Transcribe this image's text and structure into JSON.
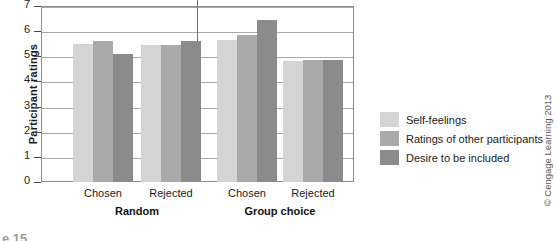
{
  "chart_data": {
    "type": "bar",
    "title": "",
    "xlabel": "",
    "ylabel": "Participant ratings",
    "ylim": [
      0,
      7
    ],
    "ytick_values": [
      0,
      1,
      2,
      3,
      4,
      5,
      6,
      7
    ],
    "ytick_labels": [
      "0",
      "1",
      "2",
      "3",
      "4",
      "5",
      "6",
      "7"
    ],
    "grid": true,
    "legend_position": "right",
    "categories": [
      "Chosen",
      "Rejected",
      "Chosen",
      "Rejected"
    ],
    "supercategories": [
      "Random",
      "Group choice"
    ],
    "series": [
      {
        "name": "Self-feelings",
        "color": "#d4d4d4",
        "values": [
          5.5,
          5.45,
          5.65,
          4.8
        ]
      },
      {
        "name": "Ratings of other participants",
        "color": "#aaaaaa",
        "values": [
          5.6,
          5.45,
          5.85,
          4.85
        ]
      },
      {
        "name": "Desire to be included",
        "color": "#8b8b8b",
        "values": [
          5.1,
          5.6,
          6.45,
          4.85
        ]
      }
    ]
  },
  "axis": {
    "y_title": "Participant ratings",
    "ticks": [
      "7",
      "6",
      "5",
      "4",
      "3",
      "2",
      "1",
      "0"
    ]
  },
  "x_axis": {
    "groups": [
      {
        "label": "Random",
        "ticks": [
          "Chosen",
          "Rejected"
        ]
      },
      {
        "label": "Group choice",
        "ticks": [
          "Chosen",
          "Rejected"
        ]
      }
    ]
  },
  "legend": {
    "items": [
      {
        "label": "Self-feelings",
        "color": "#d4d4d4"
      },
      {
        "label": "Ratings of other participants",
        "color": "#aaaaaa"
      },
      {
        "label": "Desire to be included",
        "color": "#8b8b8b"
      }
    ]
  },
  "credit": {
    "text": "© Cengage Learning 2013"
  },
  "caption": {
    "text": "e 15"
  }
}
